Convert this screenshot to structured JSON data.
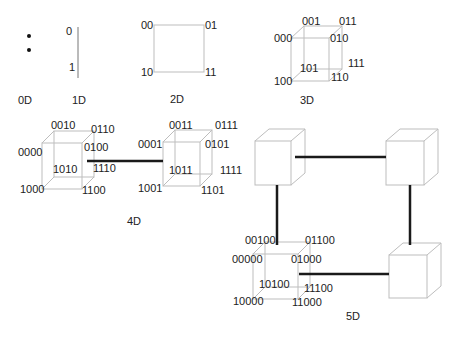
{
  "diagram": {
    "colors": {
      "edge": "#bdbdbd",
      "link": "#1a1a1a",
      "text": "#222222",
      "background": "#ffffff"
    },
    "d0": {
      "label": "0D"
    },
    "d1": {
      "label": "1D",
      "nodes": [
        "0",
        "1"
      ]
    },
    "d2": {
      "label": "2D",
      "nodes": [
        "00",
        "01",
        "10",
        "11"
      ]
    },
    "d3": {
      "label": "3D",
      "nodes": [
        "000",
        "001",
        "010",
        "011",
        "100",
        "101",
        "110",
        "111"
      ]
    },
    "d4": {
      "label": "4D",
      "cube_left": [
        "0000",
        "0010",
        "0110",
        "0100",
        "1000",
        "1010",
        "1110",
        "1100"
      ],
      "cube_right": [
        "0001",
        "0011",
        "0111",
        "0101",
        "1001",
        "1011",
        "1111",
        "1101"
      ]
    },
    "d5": {
      "label": "5D",
      "cube_labeled": [
        "00000",
        "00100",
        "01100",
        "01000",
        "10000",
        "10100",
        "11100",
        "11000"
      ]
    }
  }
}
